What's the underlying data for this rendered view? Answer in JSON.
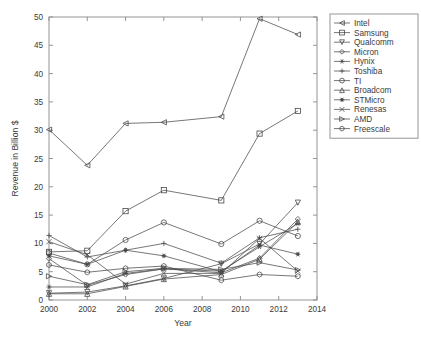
{
  "chart_data": {
    "type": "line",
    "title": "",
    "xlabel": "Year",
    "ylabel": "Revenue in Billion $",
    "xlim": [
      2000,
      2014
    ],
    "ylim": [
      0,
      50
    ],
    "xticks": [
      2000,
      2002,
      2004,
      2006,
      2008,
      2010,
      2012,
      2014
    ],
    "yticks": [
      0,
      5,
      10,
      15,
      20,
      25,
      30,
      35,
      40,
      45,
      50
    ],
    "xticklabels": [
      "2000",
      "2002",
      "2004",
      "2006",
      "2008",
      "2010",
      "2012",
      "2014"
    ],
    "yticklabels": [
      "0",
      "5",
      "10",
      "15",
      "20",
      "25",
      "30",
      "35",
      "40",
      "45",
      "50"
    ],
    "grid": false,
    "legend_position": "right-outside",
    "x": [
      2000,
      2002,
      2004,
      2006,
      2009,
      2011,
      2013
    ],
    "series": [
      {
        "name": "Intel",
        "marker": "left-triangle",
        "filled": false,
        "values": [
          30.1,
          23.8,
          31.2,
          31.4,
          32.4,
          49.7,
          46.9
        ]
      },
      {
        "name": "Samsung",
        "marker": "square",
        "filled": false,
        "values": [
          8.5,
          8.7,
          15.7,
          19.4,
          17.6,
          29.4,
          33.4
        ]
      },
      {
        "name": "Qualcomm",
        "marker": "down-triangle",
        "filled": false,
        "values": [
          1.2,
          1.4,
          2.5,
          3.8,
          6.4,
          9.9,
          17.2
        ]
      },
      {
        "name": "Micron",
        "marker": "diamond",
        "filled": false,
        "values": [
          7.3,
          2.6,
          4.5,
          5.5,
          4.8,
          7.4,
          14.3
        ]
      },
      {
        "name": "Hynix",
        "marker": "star",
        "filled": false,
        "values": [
          2.3,
          2.3,
          4.7,
          5.5,
          5.1,
          9.4,
          13.5
        ]
      },
      {
        "name": "Toshiba",
        "marker": "plus",
        "filled": false,
        "values": [
          11.4,
          7.6,
          8.8,
          10.0,
          6.5,
          11.0,
          12.5
        ]
      },
      {
        "name": "TI",
        "marker": "circle",
        "filled": false,
        "values": [
          8.3,
          6.3,
          10.6,
          13.7,
          9.9,
          14.0,
          11.3
        ]
      },
      {
        "name": "Broadcom",
        "marker": "up-triangle",
        "filled": false,
        "values": [
          1.1,
          1.1,
          2.4,
          3.7,
          4.5,
          7.2,
          13.8
        ]
      },
      {
        "name": "STMicro",
        "marker": "asterisk",
        "filled": true,
        "values": [
          7.8,
          6.3,
          8.8,
          7.8,
          5.0,
          9.7,
          8.1
        ]
      },
      {
        "name": "Renesas",
        "marker": "x",
        "filled": false,
        "values": [
          10.3,
          8.0,
          2.8,
          4.7,
          4.7,
          10.9,
          5.1
        ]
      },
      {
        "name": "AMD",
        "marker": "right-triangle",
        "filled": false,
        "values": [
          4.2,
          2.7,
          5.0,
          5.6,
          5.4,
          6.6,
          5.3
        ]
      },
      {
        "name": "Freescale",
        "marker": "hexagram",
        "filled": false,
        "values": [
          6.2,
          4.9,
          5.6,
          6.0,
          3.5,
          4.5,
          4.2
        ]
      }
    ]
  },
  "legend": {
    "entries": [
      {
        "label": "Intel"
      },
      {
        "label": "Samsung"
      },
      {
        "label": "Qualcomm"
      },
      {
        "label": "Micron"
      },
      {
        "label": "Hynix"
      },
      {
        "label": "Toshiba"
      },
      {
        "label": "TI"
      },
      {
        "label": "Broadcom"
      },
      {
        "label": "STMicro"
      },
      {
        "label": "Renesas"
      },
      {
        "label": "AMD"
      },
      {
        "label": "Freescale"
      }
    ]
  },
  "colors": {
    "line": "#4a4a4a",
    "axis": "#8a8a8a",
    "text": "#3a3a3a",
    "background": "#ffffff"
  }
}
